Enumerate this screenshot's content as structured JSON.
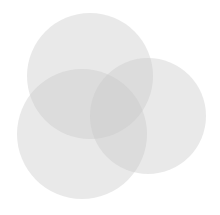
{
  "figure": {
    "type": "venn-diagram-icon",
    "circles": [
      {
        "name": "top",
        "cx": 90,
        "cy": 76,
        "r": 63,
        "color": "#c8c8c8",
        "opacity": 0.4
      },
      {
        "name": "bottom-left",
        "cx": 82,
        "cy": 134,
        "r": 65,
        "color": "#c8c8c8",
        "opacity": 0.4
      },
      {
        "name": "right",
        "cx": 148,
        "cy": 116,
        "r": 58,
        "color": "#c8c8c8",
        "opacity": 0.4
      }
    ]
  }
}
